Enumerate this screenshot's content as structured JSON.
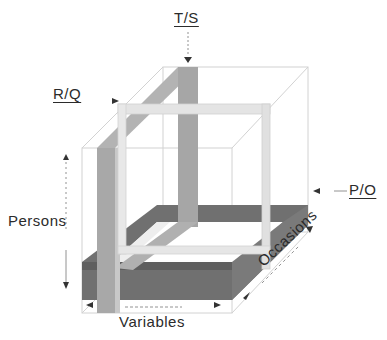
{
  "diagram": {
    "type": "3D data cube (Cattell covariation chart)",
    "axes": {
      "persons": "Persons",
      "variables": "Variables",
      "occasions": "Occasions"
    },
    "slices": [
      {
        "id": "T/S",
        "label": "T/S",
        "shade": "medium grey",
        "orientation": "vertical slab along occasions (Persons × Occasions)"
      },
      {
        "id": "R/Q",
        "label": "R/Q",
        "shade": "light grey",
        "orientation": "vertical frame facing front (Persons × Variables)"
      },
      {
        "id": "P/O",
        "label": "P/O",
        "shade": "dark grey",
        "orientation": "horizontal slab (Variables × Occasions)"
      }
    ],
    "colors": {
      "dark_slab": "#6e6e6e",
      "medium_slab": "#a9a9a9",
      "light_slab": "#e2e2e2",
      "cube_lines": "#cfcfcf",
      "text": "#2b2b2b"
    }
  }
}
